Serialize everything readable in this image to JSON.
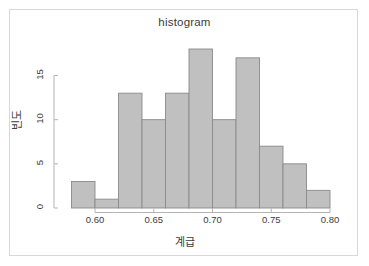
{
  "chart_data": {
    "type": "bar",
    "title": "histogram",
    "xlabel": "계급",
    "ylabel": "빈도",
    "categories": [
      "0.58-0.60",
      "0.60-0.62",
      "0.62-0.64",
      "0.64-0.66",
      "0.66-0.68",
      "0.68-0.70",
      "0.70-0.72",
      "0.72-0.74",
      "0.74-0.76",
      "0.76-0.78",
      "0.78-0.80"
    ],
    "bin_edges": [
      0.58,
      0.6,
      0.62,
      0.64,
      0.66,
      0.68,
      0.7,
      0.72,
      0.74,
      0.76,
      0.78,
      0.8
    ],
    "values": [
      3,
      1,
      13,
      10,
      13,
      18,
      10,
      17,
      7,
      5,
      2
    ],
    "xlim": [
      0.58,
      0.8
    ],
    "ylim": [
      0,
      18
    ],
    "x_ticks": [
      0.6,
      0.65,
      0.7,
      0.75,
      0.8
    ],
    "x_tick_labels": [
      "0.60",
      "0.65",
      "0.70",
      "0.75",
      "0.80"
    ],
    "y_ticks": [
      0,
      5,
      10,
      15
    ],
    "y_tick_labels": [
      "0",
      "5",
      "10",
      "15"
    ],
    "grid": false,
    "legend": null,
    "bar_fill": "#c0c0c0",
    "bar_stroke": "#8a8a8a",
    "axis_color": "#b3b3b3",
    "text_color": "#3b3b3b",
    "frame_color": "#d8d8d8",
    "background": "#ffffff"
  }
}
